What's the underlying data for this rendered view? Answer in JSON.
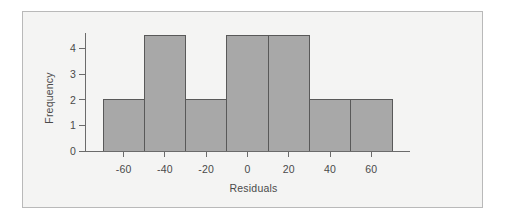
{
  "figure": {
    "background_color": "#f4f4f3",
    "frame_color": "#b9b9b9",
    "outer_background": "#ffffff"
  },
  "chart_data": {
    "type": "bar",
    "title": "",
    "subtitle": "",
    "xlabel": "Residuals",
    "ylabel": "Frequency",
    "categories": [
      "-70 to -50",
      "-50 to -30",
      "-30 to -10",
      "-10 to 10",
      "10 to 30",
      "30 to 50",
      "50 to 70"
    ],
    "bin_edges": [
      -70,
      -50,
      -30,
      -10,
      10,
      30,
      50,
      70
    ],
    "bin_width": 20,
    "values": [
      2,
      4.5,
      2,
      4.5,
      4.5,
      2,
      2
    ],
    "xlim": [
      -72,
      72
    ],
    "ylim": [
      0,
      4.6
    ],
    "xticks": [
      -60,
      -40,
      -20,
      0,
      20,
      40,
      60
    ],
    "xtick_labels": [
      "-60",
      "-40",
      "-20",
      "0",
      "20",
      "40",
      "60"
    ],
    "yticks": [
      0,
      1,
      2,
      3,
      4
    ],
    "ytick_labels": [
      "0",
      "1",
      "2",
      "3",
      "4"
    ],
    "grid": false,
    "legend": null,
    "bar_fill_color": "#a8a8a8",
    "bar_edge_color": "#595959",
    "axis_color": "#6b6b6b",
    "tick_label_color": "#4a4a4a"
  }
}
